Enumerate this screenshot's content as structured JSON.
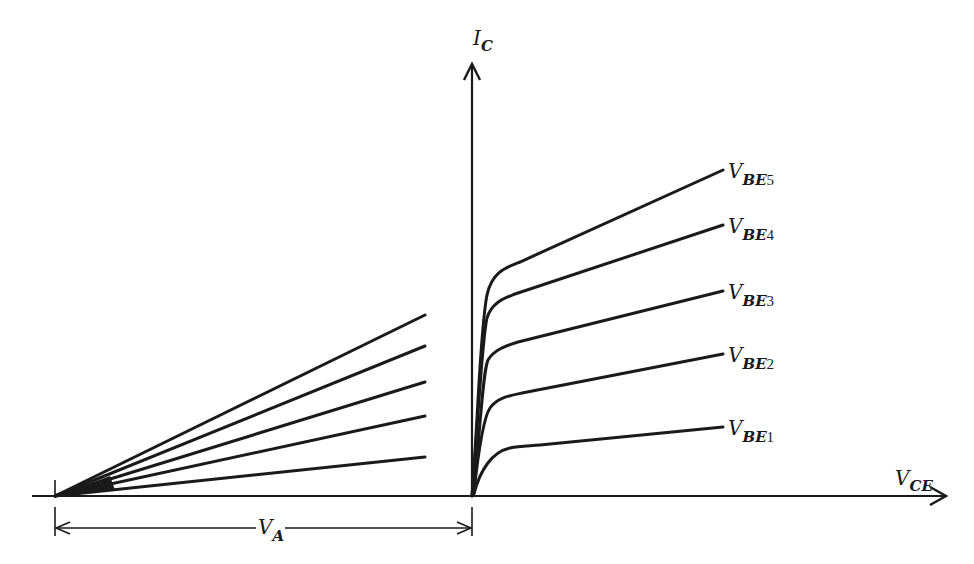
{
  "diagram": {
    "title": "",
    "colors": {
      "ink": "#1a1a1a",
      "background": "#ffffff"
    },
    "axes": {
      "y_label": {
        "main": "I",
        "sub": "C"
      },
      "x_label": {
        "main": "V",
        "sub": "CE"
      }
    },
    "dimension": {
      "label_main": "V",
      "label_sub": "A"
    },
    "curves": [
      {
        "id": "vbe1",
        "label_main": "V",
        "label_sub": "BE",
        "label_num": "1"
      },
      {
        "id": "vbe2",
        "label_main": "V",
        "label_sub": "BE",
        "label_num": "2"
      },
      {
        "id": "vbe3",
        "label_main": "V",
        "label_sub": "BE",
        "label_num": "3"
      },
      {
        "id": "vbe4",
        "label_main": "V",
        "label_sub": "BE",
        "label_num": "4"
      },
      {
        "id": "vbe5",
        "label_main": "V",
        "label_sub": "BE",
        "label_num": "5"
      }
    ]
  }
}
